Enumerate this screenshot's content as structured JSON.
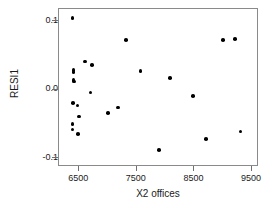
{
  "chart_data": {
    "type": "scatter",
    "title": "",
    "xlabel": "X2 offices",
    "ylabel": "RESI1",
    "xlim": [
      6150,
      9620
    ],
    "ylim": [
      -0.113,
      0.118
    ],
    "xticks": [
      6500,
      7500,
      8500,
      9500
    ],
    "xtick_labels": [
      "6500",
      "7500",
      "8500",
      "9500"
    ],
    "yticks": [
      0.1,
      0.0,
      -0.1
    ],
    "ytick_labels": [
      "0.1",
      "0.0",
      "-0.1"
    ],
    "grid": false,
    "legend": null,
    "marker": "filled-circle",
    "marker_color": "#000000",
    "points": [
      {
        "x": 6382,
        "y": 0.105
      },
      {
        "x": 6399,
        "y": 0.029
      },
      {
        "x": 6404,
        "y": 0.026
      },
      {
        "x": 6399,
        "y": 0.014
      },
      {
        "x": 6406,
        "y": 0.012
      },
      {
        "x": 6390,
        "y": -0.019
      },
      {
        "x": 6470,
        "y": -0.023
      },
      {
        "x": 6382,
        "y": -0.05
      },
      {
        "x": 6386,
        "y": -0.058
      },
      {
        "x": 6478,
        "y": -0.065
      },
      {
        "x": 6498,
        "y": -0.039
      },
      {
        "x": 6600,
        "y": 0.041
      },
      {
        "x": 6727,
        "y": 0.036
      },
      {
        "x": 6698,
        "y": -0.004
      },
      {
        "x": 7000,
        "y": -0.034
      },
      {
        "x": 7310,
        "y": 0.073
      },
      {
        "x": 7170,
        "y": -0.026
      },
      {
        "x": 7566,
        "y": 0.027
      },
      {
        "x": 7880,
        "y": -0.088
      },
      {
        "x": 8080,
        "y": 0.017
      },
      {
        "x": 8480,
        "y": -0.009
      },
      {
        "x": 8700,
        "y": -0.072
      },
      {
        "x": 9000,
        "y": 0.073
      },
      {
        "x": 9200,
        "y": 0.074
      },
      {
        "x": 9300,
        "y": -0.061
      }
    ]
  }
}
